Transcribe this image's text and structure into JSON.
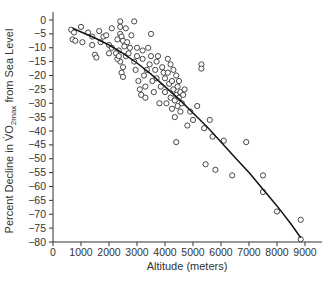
{
  "chart_data": {
    "type": "scatter",
    "title": "",
    "xlabel": "Altitude (meters)",
    "ylabel": {
      "prefix": "Percent Decline in ",
      "symbol": "V̇O",
      "subscript": "2max",
      "suffix": " from Sea Level"
    },
    "xlim": [
      0,
      9500
    ],
    "ylim": [
      -80,
      3
    ],
    "x_ticks": [
      0,
      1000,
      2000,
      3000,
      4000,
      5000,
      6000,
      7000,
      8000,
      9000
    ],
    "y_ticks": [
      0,
      -5,
      -10,
      -15,
      -20,
      -25,
      -30,
      -35,
      -40,
      -45,
      -50,
      -55,
      -60,
      -65,
      -70,
      -75,
      -80
    ],
    "grid": false,
    "legend": null,
    "marker": "open-circle",
    "fit_curve": {
      "description": "curvilinear regression line",
      "points": [
        [
          700,
          -3
        ],
        [
          1500,
          -6.5
        ],
        [
          2000,
          -9
        ],
        [
          2500,
          -12
        ],
        [
          3000,
          -15.5
        ],
        [
          3500,
          -19.5
        ],
        [
          4000,
          -24
        ],
        [
          4500,
          -28.5
        ],
        [
          5000,
          -33.5
        ],
        [
          5500,
          -38.5
        ],
        [
          6000,
          -44
        ],
        [
          6500,
          -49.5
        ],
        [
          7000,
          -55
        ],
        [
          7500,
          -61
        ],
        [
          8000,
          -67
        ],
        [
          8500,
          -73.5
        ],
        [
          8848,
          -78.5
        ]
      ]
    },
    "points": [
      [
        650,
        -3.5
      ],
      [
        700,
        -7
      ],
      [
        800,
        -7.5
      ],
      [
        750,
        -4.5
      ],
      [
        1000,
        -2.5
      ],
      [
        1050,
        -8
      ],
      [
        1250,
        -4.5
      ],
      [
        1400,
        -6
      ],
      [
        1400,
        -9
      ],
      [
        1650,
        -4
      ],
      [
        1700,
        -8
      ],
      [
        1800,
        -6
      ],
      [
        1900,
        -5.5
      ],
      [
        1500,
        -12.5
      ],
      [
        1550,
        -13.5
      ],
      [
        2000,
        -9
      ],
      [
        2000,
        -12
      ],
      [
        2100,
        -3
      ],
      [
        2100,
        -10
      ],
      [
        2300,
        -7
      ],
      [
        2350,
        -11
      ],
      [
        2400,
        -0.5
      ],
      [
        2400,
        -2.5
      ],
      [
        2400,
        -5
      ],
      [
        2400,
        -15
      ],
      [
        2450,
        -6
      ],
      [
        2500,
        -7.5
      ],
      [
        2500,
        -17
      ],
      [
        2550,
        -9.5
      ],
      [
        2600,
        -3
      ],
      [
        2250,
        -12
      ],
      [
        2300,
        -14
      ],
      [
        2350,
        -13
      ],
      [
        2450,
        -19
      ],
      [
        2500,
        -20.5
      ],
      [
        2600,
        -13
      ],
      [
        2650,
        -8
      ],
      [
        2700,
        -12
      ],
      [
        2750,
        -10
      ],
      [
        2800,
        -5.5
      ],
      [
        2900,
        -0.5
      ],
      [
        2900,
        -15
      ],
      [
        2950,
        -18
      ],
      [
        3000,
        -10
      ],
      [
        3000,
        -13
      ],
      [
        3050,
        -22
      ],
      [
        3100,
        -25
      ],
      [
        3150,
        -27
      ],
      [
        3200,
        -11
      ],
      [
        3200,
        -14
      ],
      [
        3250,
        -20
      ],
      [
        3300,
        -24
      ],
      [
        3300,
        -28
      ],
      [
        3350,
        -18
      ],
      [
        3400,
        -10
      ],
      [
        3450,
        -16
      ],
      [
        3500,
        -5
      ],
      [
        3500,
        -13
      ],
      [
        3550,
        -22
      ],
      [
        3600,
        -26
      ],
      [
        3650,
        -18
      ],
      [
        3700,
        -15
      ],
      [
        3700,
        -21
      ],
      [
        3750,
        -13
      ],
      [
        3800,
        -30
      ],
      [
        3850,
        -24
      ],
      [
        3900,
        -17
      ],
      [
        3950,
        -19
      ],
      [
        4000,
        -21
      ],
      [
        4000,
        -26
      ],
      [
        4050,
        -30
      ],
      [
        4100,
        -14
      ],
      [
        4100,
        -19
      ],
      [
        4150,
        -23
      ],
      [
        4200,
        -16
      ],
      [
        4200,
        -28
      ],
      [
        4250,
        -32
      ],
      [
        4250,
        -22
      ],
      [
        4300,
        -18
      ],
      [
        4300,
        -25
      ],
      [
        4350,
        -29
      ],
      [
        4350,
        -35
      ],
      [
        4400,
        -20
      ],
      [
        4400,
        -27
      ],
      [
        4450,
        -24
      ],
      [
        4450,
        -31
      ],
      [
        4500,
        -22
      ],
      [
        4500,
        -28
      ],
      [
        4550,
        -26
      ],
      [
        4550,
        -33
      ],
      [
        4600,
        -30
      ],
      [
        4650,
        -27
      ],
      [
        4700,
        -25
      ],
      [
        4400,
        -44
      ],
      [
        4800,
        -38
      ],
      [
        4900,
        -33
      ],
      [
        5000,
        -36
      ],
      [
        5150,
        -31
      ],
      [
        5300,
        -16
      ],
      [
        5300,
        -17.5
      ],
      [
        5400,
        -39
      ],
      [
        5450,
        -52
      ],
      [
        5600,
        -36
      ],
      [
        5700,
        -42
      ],
      [
        5800,
        -54
      ],
      [
        6100,
        -43.5
      ],
      [
        6400,
        -56
      ],
      [
        6900,
        -44
      ],
      [
        7500,
        -62
      ],
      [
        7500,
        -56
      ],
      [
        8000,
        -69
      ],
      [
        8848,
        -72
      ],
      [
        8848,
        -79
      ]
    ]
  }
}
